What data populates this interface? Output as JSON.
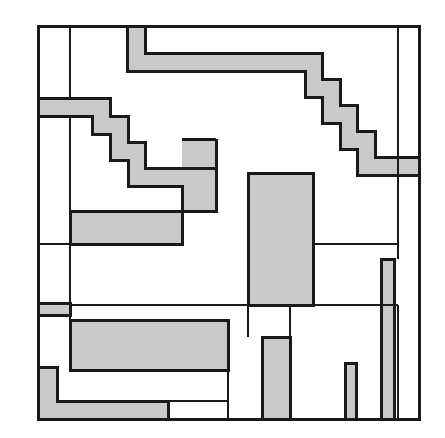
{
  "artwork": {
    "title": "Abstract Rectilinear Composition",
    "medium": "line drawing",
    "canvas": {
      "width": 445,
      "height": 438
    },
    "background_color": "#ffffff",
    "ink_color": "#1a1a1a",
    "fill_color": "#c9c9c9",
    "stroke_width": 3,
    "thin_stroke_width": 2,
    "frame": {
      "x": 38,
      "y": 26,
      "width": 381,
      "height": 393
    }
  },
  "chart_data": {
    "type": "diagram",
    "grid": false,
    "legend": false,
    "xlim": [
      0,
      445
    ],
    "ylim": [
      0,
      438
    ]
  },
  "gray_fills": [
    {
      "name": "top-staircase-band",
      "points": "127,26 145,26 145,53 322,53 322,79 340,79 340,105 357,105 357,131 375,131 375,157 419,157 419,175 357,175 357,149 340,149 340,123 322,123 322,97 305,97 305,71 127,71"
    },
    {
      "name": "upper-left-step-band",
      "points": "38,98 110,98 110,116 128,116 128,142 145,142 145,168 216,168 216,211 182,211 182,186 128,186 128,160 110,160 110,134 92,134 92,116 38,116"
    },
    {
      "name": "mid-left-gray-block",
      "x": 70,
      "y": 211,
      "width": 112,
      "height": 33
    },
    {
      "name": "upper-mid-gray-column",
      "x": 182,
      "y": 139,
      "width": 34,
      "height": 72
    },
    {
      "name": "central-tall-gray-block",
      "x": 248,
      "y": 173,
      "width": 65,
      "height": 132
    },
    {
      "name": "left-short-band",
      "x": 38,
      "y": 303,
      "width": 32,
      "height": 12
    },
    {
      "name": "lower-wide-gray-block",
      "x": 70,
      "y": 320,
      "width": 158,
      "height": 50
    },
    {
      "name": "bottom-left-l-path",
      "points": "38,367 57,367 57,401 168,401 168,419 38,419"
    },
    {
      "name": "bottom-center-gray-bar",
      "x": 262,
      "y": 337,
      "width": 28,
      "height": 82
    },
    {
      "name": "bottom-thin-bar-short",
      "x": 345,
      "y": 363,
      "width": 11,
      "height": 56
    },
    {
      "name": "bottom-thin-bar-tall",
      "x": 381,
      "y": 259,
      "width": 13,
      "height": 160
    }
  ],
  "outlines": [
    {
      "name": "frame-outline",
      "type": "rect",
      "x": 38,
      "y": 26,
      "width": 381,
      "height": 393
    },
    {
      "name": "top-staircase-outer",
      "type": "polyline",
      "points": "127,26 127,71 305,71 305,97 322,97 322,123 340,123 340,149 357,149 357,175 419,175"
    },
    {
      "name": "top-staircase-inner",
      "type": "polyline",
      "points": "145,26 145,53 322,53 322,79 340,79 340,105 357,105 357,131 375,131 375,157 419,157"
    },
    {
      "name": "upper-left-band-top",
      "type": "polyline",
      "points": "38,98 110,98 110,116 128,116 128,142 145,142 145,168 216,168"
    },
    {
      "name": "upper-left-band-bottom",
      "type": "polyline",
      "points": "38,116 92,116 92,134 110,134 110,160 128,160 128,186 182,186 182,211"
    },
    {
      "name": "upper-mid-column-outline",
      "type": "polyline",
      "points": "216,139 216,211 182,211"
    },
    {
      "name": "upper-mid-column-left",
      "type": "line",
      "x1": 182,
      "y1": 139,
      "x2": 216,
      "y2": 139
    },
    {
      "name": "mid-left-block-outline",
      "type": "rect",
      "x": 70,
      "y": 211,
      "width": 112,
      "height": 33
    },
    {
      "name": "central-block-outline",
      "type": "rect",
      "x": 248,
      "y": 173,
      "width": 65,
      "height": 132
    },
    {
      "name": "lower-wide-block-outline",
      "type": "rect",
      "x": 70,
      "y": 320,
      "width": 158,
      "height": 50
    },
    {
      "name": "bottom-center-bar-outline",
      "type": "rect",
      "x": 262,
      "y": 337,
      "width": 28,
      "height": 82
    },
    {
      "name": "bottom-thin-bar-short-outline",
      "type": "rect",
      "x": 345,
      "y": 363,
      "width": 11,
      "height": 56
    },
    {
      "name": "bottom-thin-bar-tall-outline",
      "type": "rect",
      "x": 381,
      "y": 259,
      "width": 13,
      "height": 160
    },
    {
      "name": "left-short-band-outline",
      "type": "polyline",
      "points": "38,303 70,303 70,315 38,315"
    },
    {
      "name": "bottom-left-l-outline",
      "type": "polyline",
      "points": "38,367 57,367 57,401 168,401 168,419"
    }
  ],
  "thin_lines": [
    {
      "name": "left-inner-vertical-upper",
      "x1": 70,
      "y1": 26,
      "x2": 70,
      "y2": 98
    },
    {
      "name": "left-inner-vertical-mid",
      "x1": 70,
      "y1": 116,
      "x2": 70,
      "y2": 244
    },
    {
      "name": "left-inner-vertical-lower",
      "x1": 70,
      "y1": 244,
      "x2": 70,
      "y2": 303
    },
    {
      "name": "left-inner-vertical-bottom",
      "x1": 70,
      "y1": 315,
      "x2": 70,
      "y2": 367
    },
    {
      "name": "horizontal-mid-left",
      "x1": 38,
      "y1": 244,
      "x2": 70,
      "y2": 244
    },
    {
      "name": "horizontal-row-divider",
      "x1": 70,
      "y1": 305,
      "x2": 248,
      "y2": 305
    },
    {
      "name": "horizontal-row-divider-right",
      "x1": 313,
      "y1": 305,
      "x2": 398,
      "y2": 305
    },
    {
      "name": "vertical-center-lower",
      "x1": 290,
      "y1": 305,
      "x2": 290,
      "y2": 419
    },
    {
      "name": "vertical-right-inner",
      "x1": 398,
      "y1": 26,
      "x2": 398,
      "y2": 259
    },
    {
      "name": "vertical-right-inner-lower",
      "x1": 398,
      "y1": 305,
      "x2": 398,
      "y2": 419
    },
    {
      "name": "horizontal-right-upper",
      "x1": 313,
      "y1": 244,
      "x2": 398,
      "y2": 244
    },
    {
      "name": "vertical-lower-left-tick",
      "x1": 228,
      "y1": 370,
      "x2": 228,
      "y2": 419
    },
    {
      "name": "horizontal-bottom-tick",
      "x1": 168,
      "y1": 401,
      "x2": 228,
      "y2": 401
    },
    {
      "name": "vertical-mid-tall",
      "x1": 248,
      "y1": 305,
      "x2": 248,
      "y2": 337
    }
  ]
}
